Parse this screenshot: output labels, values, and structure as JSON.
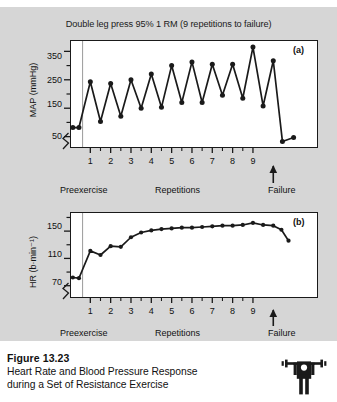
{
  "figure": {
    "chart_title": "Double leg press 95% 1 RM (9 repetitions to failure)",
    "caption_number": "Figure 13.23",
    "caption_line1": "Heart Rate and Blood Pressure Response",
    "caption_line2": "during a Set of Resistance Exercise",
    "lifter_icon_name": "weightlifter-icon",
    "panel_bg_color": "#d6d6d6",
    "plot_bg_color": "#ffffff",
    "line_color": "#1a1a1a"
  },
  "chart_data": [
    {
      "type": "line",
      "panel_letter": "(a)",
      "title": "Double leg press 95% 1 RM (9 repetitions to failure)",
      "xlabel": "",
      "ylabel": "MAP (mmHg)",
      "ylim": [
        10,
        390
      ],
      "yticks": [
        50,
        150,
        250,
        350
      ],
      "ytick_labels": [
        "50",
        "150",
        "250",
        "350"
      ],
      "yminor_ticks": [
        100,
        200,
        300
      ],
      "axis_break": true,
      "grid": false,
      "legend": "none",
      "xlim": [
        0,
        12.2
      ],
      "xticks": [
        1,
        2,
        3,
        4,
        5,
        6,
        7,
        8,
        9
      ],
      "xtick_labels": [
        "1",
        "2",
        "3",
        "4",
        "5",
        "6",
        "7",
        "8",
        "9"
      ],
      "xminor_ticks": [
        1.5,
        2.5,
        3.5,
        4.5,
        5.5,
        6.5,
        7.5,
        8.5
      ],
      "preexercise_divider_x": 0.62,
      "failure_marker_x": 10.0,
      "annotations": [
        "Preexercise",
        "Repetitions",
        "Failure"
      ],
      "x": [
        0.14,
        0.44,
        1.0,
        1.5,
        2.0,
        2.5,
        3.0,
        3.5,
        4.0,
        4.5,
        5.0,
        5.5,
        6.0,
        6.5,
        7.0,
        7.5,
        8.0,
        8.5,
        9.0,
        9.5,
        10.0,
        10.45,
        11.0
      ],
      "values": [
        82,
        82,
        243,
        103,
        237,
        122,
        250,
        150,
        270,
        153,
        300,
        170,
        313,
        170,
        305,
        196,
        305,
        185,
        365,
        158,
        317,
        33,
        47
      ],
      "series_name": "MAP"
    },
    {
      "type": "line",
      "panel_letter": "(b)",
      "title": "",
      "xlabel": "",
      "ylabel": "HR (b·min⁻¹)",
      "ylim": [
        52,
        178
      ],
      "yticks": [
        70,
        110,
        150
      ],
      "ytick_labels": [
        "70",
        "110",
        "150"
      ],
      "yminor_ticks": [
        90,
        130,
        170
      ],
      "axis_break": true,
      "grid": false,
      "legend": "none",
      "xlim": [
        0,
        12.2
      ],
      "xticks": [
        1,
        2,
        3,
        4,
        5,
        6,
        7,
        8,
        9
      ],
      "xtick_labels": [
        "1",
        "2",
        "3",
        "4",
        "5",
        "6",
        "7",
        "8",
        "9"
      ],
      "xminor_ticks": [
        1.5,
        2.5,
        3.5,
        4.5,
        5.5,
        6.5,
        7.5,
        8.5
      ],
      "preexercise_divider_x": 0.62,
      "failure_marker_x": 10.0,
      "annotations": [
        "Preexercise",
        "Repetitions",
        "Failure"
      ],
      "x": [
        0.14,
        0.44,
        1.0,
        1.5,
        2.0,
        2.5,
        3.0,
        3.5,
        4.0,
        4.5,
        5.0,
        5.5,
        6.0,
        6.5,
        7.0,
        7.5,
        8.0,
        8.5,
        9.0,
        9.5,
        10.0,
        10.4,
        10.75
      ],
      "values": [
        82,
        81,
        121,
        115,
        128,
        127,
        141,
        148,
        151,
        153,
        154,
        155,
        155,
        156,
        157,
        158,
        158,
        159,
        162,
        159,
        158,
        152,
        136
      ],
      "series_name": "HR"
    }
  ],
  "panel_a_axis_notes": {
    "preexercise": "Preexercise",
    "repetitions": "Repetitions",
    "failure": "Failure"
  },
  "panel_b_axis_notes": {
    "preexercise": "Preexercise",
    "repetitions": "Repetitions",
    "failure": "Failure"
  }
}
